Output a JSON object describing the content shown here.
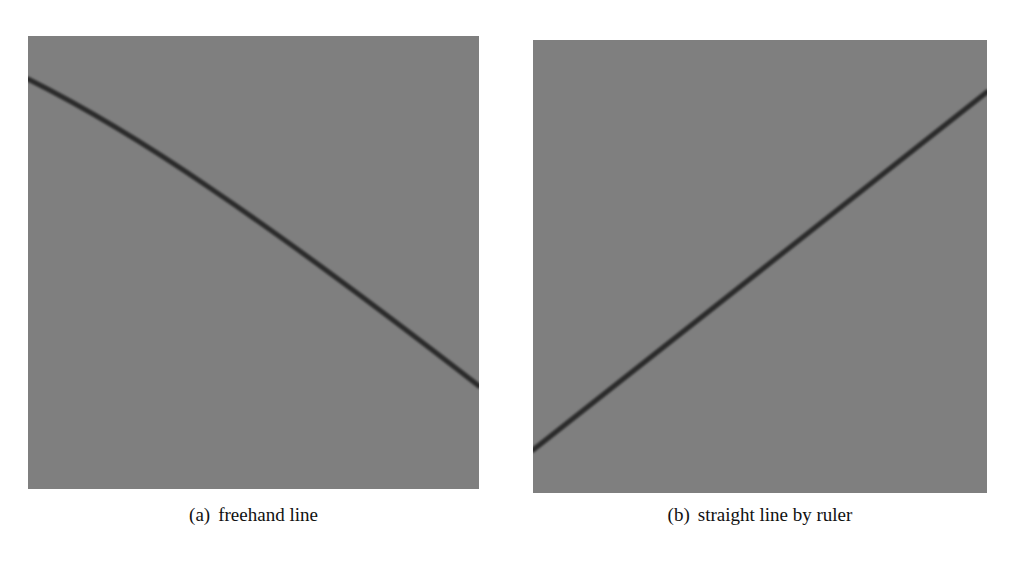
{
  "figure": {
    "panels": [
      {
        "id": "a",
        "label": "(a)",
        "caption": "freehand line",
        "background_color": "#7f7f7f",
        "line_color": "#2a2a2a",
        "line_type": "freehand (slightly curved)",
        "line_points_px": [
          [
            28,
            79
          ],
          [
            150,
            148
          ],
          [
            350,
            282
          ],
          [
            479,
            386
          ]
        ]
      },
      {
        "id": "b",
        "label": "(b)",
        "caption": "straight line by ruler",
        "background_color": "#7f7f7f",
        "line_color": "#2a2a2a",
        "line_type": "straight",
        "line_points_px": [
          [
            533,
            450
          ],
          [
            987,
            92
          ]
        ]
      }
    ]
  }
}
